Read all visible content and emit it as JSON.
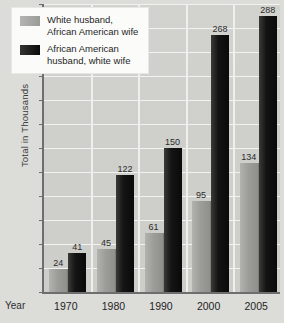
{
  "chart_data": {
    "type": "bar",
    "title": "",
    "xlabel": "Year",
    "ylabel": "Total in Thousands",
    "ylim": [
      0,
      300
    ],
    "yticks": [
      0,
      25,
      50,
      75,
      100,
      125,
      150,
      175,
      200,
      225,
      250,
      275,
      300
    ],
    "grid": true,
    "legend_position": "top-left",
    "categories": [
      "1970",
      "1980",
      "1990",
      "2000",
      "2005"
    ],
    "series": [
      {
        "name": "White husband,\nAfrican American wife",
        "color": "#9d9d99",
        "values": [
          24,
          45,
          61,
          95,
          134
        ]
      },
      {
        "name": "African American\nhusband, white wife",
        "color": "#121212",
        "values": [
          41,
          122,
          150,
          268,
          288
        ]
      }
    ]
  },
  "axis": {
    "year_label": "Year",
    "y_title": "Total in Thousands"
  },
  "colors": {
    "plot_background": "#cfcfcb",
    "page_background": "#dcdcd8",
    "gridline": "#f2f2f0",
    "axis": "#6e6e6e",
    "series_light": "#9d9d99",
    "series_dark": "#121212",
    "legend_background": "#fbfbf9"
  }
}
